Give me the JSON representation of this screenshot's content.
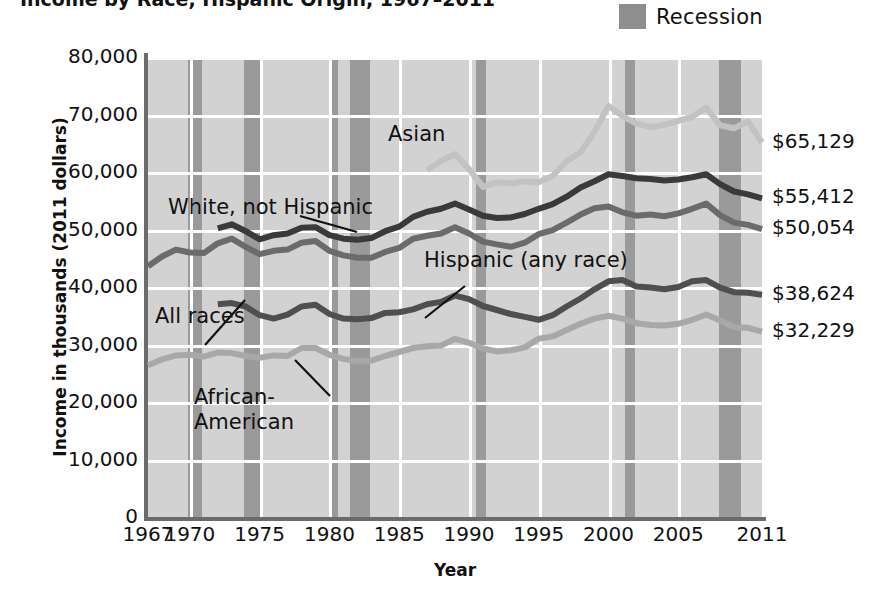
{
  "title": "Income by Race, Hispanic Origin, 1967–2011",
  "legend": {
    "label": "Recession",
    "swatch_color": "#8e8e8e"
  },
  "axes": {
    "ylabel": "Income in thousands (2011 dollars)",
    "xlabel": "Year",
    "yticks": [
      "80,000",
      "70,000",
      "60,000",
      "50,000",
      "40,000",
      "30,000",
      "20,000",
      "10,000",
      "0"
    ],
    "xticks": [
      "1967",
      "1970",
      "1975",
      "1980",
      "1985",
      "1990",
      "1995",
      "2000",
      "2005",
      "2011"
    ]
  },
  "annotations": [
    {
      "name": "asian",
      "text": "Asian"
    },
    {
      "name": "white-not-hispanic",
      "text": "White, not Hispanic"
    },
    {
      "name": "all-races",
      "text": "All races"
    },
    {
      "name": "hispanic",
      "text": "Hispanic (any race)"
    },
    {
      "name": "african-american-line1",
      "text": "African-"
    },
    {
      "name": "african-american-line2",
      "text": "American"
    }
  ],
  "end_labels": [
    {
      "name": "asian",
      "value": "$65,129"
    },
    {
      "name": "white-not-hispanic",
      "value": "$55,412"
    },
    {
      "name": "all-races",
      "value": "$50,054"
    },
    {
      "name": "hispanic",
      "value": "$38,624"
    },
    {
      "name": "african-american",
      "value": "$32,229"
    }
  ],
  "chart_data": {
    "type": "line",
    "title": "Income by Race, Hispanic Origin, 1967–2011",
    "xlabel": "Year",
    "ylabel": "Income in thousands (2011 dollars)",
    "xlim": [
      1967,
      2011
    ],
    "ylim": [
      0,
      80000
    ],
    "ytick_values": [
      0,
      10000,
      20000,
      30000,
      40000,
      50000,
      60000,
      70000,
      80000
    ],
    "xtick_values": [
      1967,
      1970,
      1975,
      1980,
      1985,
      1990,
      1995,
      2000,
      2005,
      2011
    ],
    "grid": true,
    "legend_position": "top-right",
    "legend_entries": [
      "Recession"
    ],
    "plot_background": "#d2d2d2",
    "recession_bands": [
      [
        1969.9,
        1970.9
      ],
      [
        1973.9,
        1975.2
      ],
      [
        1980.0,
        1980.6
      ],
      [
        1981.5,
        1982.9
      ],
      [
        1990.5,
        1991.2
      ],
      [
        2001.2,
        2001.9
      ],
      [
        2007.9,
        2009.5
      ]
    ],
    "series": [
      {
        "name": "Asian",
        "color": "#c2c2c2",
        "end_label": "$65,129",
        "x": [
          1987,
          1988,
          1989,
          1990,
          1991,
          1992,
          1993,
          1994,
          1995,
          1996,
          1997,
          1998,
          1999,
          2000,
          2001,
          2002,
          2003,
          2004,
          2005,
          2006,
          2007,
          2008,
          2009,
          2010,
          2011
        ],
        "values": [
          60300,
          61900,
          63100,
          60500,
          57400,
          58200,
          58000,
          58400,
          58200,
          59300,
          61900,
          63400,
          67000,
          71500,
          69700,
          68400,
          67800,
          68200,
          68900,
          69600,
          71200,
          68100,
          67600,
          68800,
          65129
        ]
      },
      {
        "name": "White, not Hispanic",
        "color": "#3a3a3a",
        "end_label": "$55,412",
        "x": [
          1972,
          1973,
          1974,
          1975,
          1976,
          1977,
          1978,
          1979,
          1980,
          1981,
          1982,
          1983,
          1984,
          1985,
          1986,
          1987,
          1988,
          1989,
          1990,
          1991,
          1992,
          1993,
          1994,
          1995,
          1996,
          1997,
          1998,
          1999,
          2000,
          2001,
          2002,
          2003,
          2004,
          2005,
          2006,
          2007,
          2008,
          2009,
          2010,
          2011
        ],
        "values": [
          50200,
          50900,
          49700,
          48300,
          49000,
          49300,
          50300,
          50400,
          49000,
          48400,
          48200,
          48500,
          49700,
          50500,
          52200,
          53100,
          53600,
          54500,
          53500,
          52400,
          52000,
          52100,
          52700,
          53600,
          54400,
          55700,
          57300,
          58400,
          59600,
          59300,
          58900,
          58800,
          58500,
          58700,
          59100,
          59600,
          57900,
          56600,
          56100,
          55412
        ]
      },
      {
        "name": "All races",
        "color": "#6b6b6b",
        "end_label": "$50,054",
        "x": [
          1967,
          1968,
          1969,
          1970,
          1971,
          1972,
          1973,
          1974,
          1975,
          1976,
          1977,
          1978,
          1979,
          1980,
          1981,
          1982,
          1983,
          1984,
          1985,
          1986,
          1987,
          1988,
          1989,
          1990,
          1991,
          1992,
          1993,
          1994,
          1995,
          1996,
          1997,
          1998,
          1999,
          2000,
          2001,
          2002,
          2003,
          2004,
          2005,
          2006,
          2007,
          2008,
          2009,
          2010,
          2011
        ],
        "values": [
          43600,
          45300,
          46500,
          46000,
          45900,
          47600,
          48400,
          47000,
          45700,
          46300,
          46500,
          47700,
          48000,
          46300,
          45500,
          45100,
          45100,
          46100,
          46800,
          48400,
          48900,
          49300,
          50400,
          49300,
          47900,
          47400,
          47000,
          47700,
          49200,
          49900,
          51200,
          52600,
          53700,
          54000,
          53000,
          52400,
          52600,
          52300,
          52800,
          53600,
          54500,
          52500,
          51200,
          50800,
          50054
        ]
      },
      {
        "name": "Hispanic (any race)",
        "color": "#4f4f4f",
        "end_label": "$38,624",
        "x": [
          1972,
          1973,
          1974,
          1975,
          1976,
          1977,
          1978,
          1979,
          1980,
          1981,
          1982,
          1983,
          1984,
          1985,
          1986,
          1987,
          1988,
          1989,
          1990,
          1991,
          1992,
          1993,
          1994,
          1995,
          1996,
          1997,
          1998,
          1999,
          2000,
          2001,
          2002,
          2003,
          2004,
          2005,
          2006,
          2007,
          2008,
          2009,
          2010,
          2011
        ],
        "values": [
          37000,
          37200,
          36600,
          35100,
          34500,
          35200,
          36600,
          36900,
          35300,
          34500,
          34400,
          34600,
          35500,
          35600,
          36100,
          37000,
          37400,
          38500,
          37900,
          36700,
          36000,
          35300,
          34800,
          34300,
          35100,
          36600,
          38000,
          39600,
          41000,
          41200,
          40100,
          39900,
          39600,
          40000,
          41000,
          41200,
          39900,
          39100,
          39000,
          38624
        ]
      },
      {
        "name": "African-American",
        "color": "#a8a8a8",
        "end_label": "$32,229",
        "x": [
          1967,
          1968,
          1969,
          1970,
          1971,
          1972,
          1973,
          1974,
          1975,
          1976,
          1977,
          1978,
          1979,
          1980,
          1981,
          1982,
          1983,
          1984,
          1985,
          1986,
          1987,
          1988,
          1989,
          1990,
          1991,
          1992,
          1993,
          1994,
          1995,
          1996,
          1997,
          1998,
          1999,
          2000,
          2001,
          2002,
          2003,
          2004,
          2005,
          2006,
          2007,
          2008,
          2009,
          2010,
          2011
        ],
        "values": [
          26400,
          27400,
          28100,
          28200,
          27900,
          28600,
          28500,
          28000,
          27700,
          28100,
          28000,
          29400,
          29400,
          28200,
          27500,
          27100,
          27200,
          28000,
          28700,
          29400,
          29700,
          29800,
          31000,
          30300,
          29300,
          28800,
          29000,
          29500,
          31000,
          31400,
          32500,
          33600,
          34500,
          35000,
          34500,
          33700,
          33400,
          33300,
          33600,
          34300,
          35200,
          34200,
          33000,
          32900,
          32229
        ]
      }
    ]
  }
}
